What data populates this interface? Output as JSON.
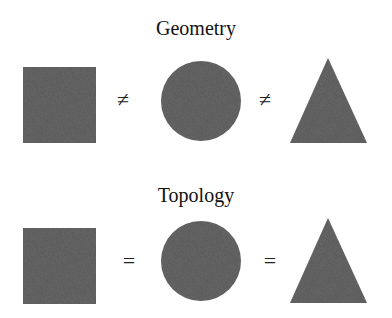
{
  "rows": [
    {
      "title": "Geometry",
      "shapes": [
        "square",
        "circle",
        "triangle"
      ],
      "operators": [
        "≠",
        "≠"
      ]
    },
    {
      "title": "Topology",
      "shapes": [
        "square",
        "circle",
        "triangle"
      ],
      "operators": [
        "=",
        "="
      ]
    }
  ],
  "colors": {
    "shape_fill": "#6b6b6b",
    "text": "#111111"
  }
}
